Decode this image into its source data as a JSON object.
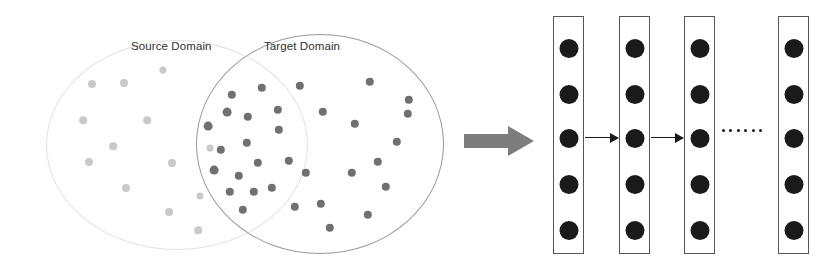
{
  "figure": {
    "labels": {
      "source_domain": "Source Domain",
      "target_domain": "Target Domain",
      "ellipsis": "······"
    },
    "colors": {
      "source_dot": "#c9c9c9",
      "target_dot": "#707070",
      "source_ellipse_border": "#e2e2e2",
      "target_ellipse_border": "#9a9a9a",
      "block_arrow": "#7d7d7d",
      "node": "#1a1a1a",
      "layer_border": "#555555",
      "background": "#ffffff"
    }
  },
  "venn": {
    "source_ellipse": {
      "cx": 176,
      "cy": 144,
      "rx": 130,
      "ry": 104
    },
    "target_ellipse": {
      "cx": 319,
      "cy": 143,
      "rx": 123,
      "ry": 109
    },
    "source_dots": [
      {
        "x": 92,
        "y": 84,
        "r": 4.0
      },
      {
        "x": 124,
        "y": 83,
        "r": 4.0
      },
      {
        "x": 163,
        "y": 70,
        "r": 3.6
      },
      {
        "x": 83,
        "y": 120,
        "r": 3.8
      },
      {
        "x": 147,
        "y": 120,
        "r": 3.8
      },
      {
        "x": 113,
        "y": 146,
        "r": 3.8
      },
      {
        "x": 89,
        "y": 162,
        "r": 4.0
      },
      {
        "x": 126,
        "y": 188,
        "r": 4.0
      },
      {
        "x": 172,
        "y": 163,
        "r": 4.0
      },
      {
        "x": 169,
        "y": 212,
        "r": 4.0
      },
      {
        "x": 198,
        "y": 230,
        "r": 3.8
      },
      {
        "x": 200,
        "y": 196,
        "r": 3.6
      },
      {
        "x": 210,
        "y": 148,
        "r": 3.4
      }
    ],
    "target_dots": [
      {
        "x": 232,
        "y": 95,
        "r": 4.2
      },
      {
        "x": 262,
        "y": 88,
        "r": 4.2
      },
      {
        "x": 248,
        "y": 117,
        "r": 4.2
      },
      {
        "x": 278,
        "y": 110,
        "r": 4.2
      },
      {
        "x": 227,
        "y": 112,
        "r": 4.4
      },
      {
        "x": 208,
        "y": 126,
        "r": 4.4
      },
      {
        "x": 247,
        "y": 143,
        "r": 4.2
      },
      {
        "x": 279,
        "y": 130,
        "r": 4.2
      },
      {
        "x": 221,
        "y": 150,
        "r": 4.2
      },
      {
        "x": 214,
        "y": 170,
        "r": 4.4
      },
      {
        "x": 239,
        "y": 176,
        "r": 4.2
      },
      {
        "x": 258,
        "y": 163,
        "r": 4.2
      },
      {
        "x": 254,
        "y": 192,
        "r": 4.2
      },
      {
        "x": 230,
        "y": 192,
        "r": 4.2
      },
      {
        "x": 243,
        "y": 210,
        "r": 4.2
      },
      {
        "x": 272,
        "y": 188,
        "r": 4.2
      },
      {
        "x": 289,
        "y": 161,
        "r": 4.2
      },
      {
        "x": 295,
        "y": 207,
        "r": 4.2
      },
      {
        "x": 300,
        "y": 86,
        "r": 4.2
      },
      {
        "x": 370,
        "y": 82,
        "r": 4.2
      },
      {
        "x": 323,
        "y": 112,
        "r": 4.2
      },
      {
        "x": 409,
        "y": 100,
        "r": 4.2
      },
      {
        "x": 408,
        "y": 114,
        "r": 4.2
      },
      {
        "x": 355,
        "y": 124,
        "r": 4.2
      },
      {
        "x": 397,
        "y": 142,
        "r": 4.2
      },
      {
        "x": 378,
        "y": 162,
        "r": 4.2
      },
      {
        "x": 352,
        "y": 173,
        "r": 4.2
      },
      {
        "x": 306,
        "y": 173,
        "r": 4.2
      },
      {
        "x": 386,
        "y": 187,
        "r": 4.2
      },
      {
        "x": 321,
        "y": 204,
        "r": 4.2
      },
      {
        "x": 368,
        "y": 215,
        "r": 4.2
      },
      {
        "x": 330,
        "y": 228,
        "r": 4.2
      }
    ]
  },
  "network": {
    "layers": [
      {
        "id": "layer-1",
        "x": 553,
        "nodes": 5
      },
      {
        "id": "layer-2",
        "x": 619,
        "nodes": 5
      },
      {
        "id": "layer-3",
        "x": 684,
        "nodes": 5
      },
      {
        "id": "layer-n",
        "x": 778,
        "nodes": 5
      }
    ],
    "connections": [
      {
        "from": "layer-1",
        "to": "layer-2",
        "x": 585,
        "width": 33
      },
      {
        "from": "layer-2",
        "to": "layer-3",
        "x": 651,
        "width": 32
      }
    ],
    "ellipsis_between": [
      "layer-3",
      "layer-n"
    ]
  }
}
